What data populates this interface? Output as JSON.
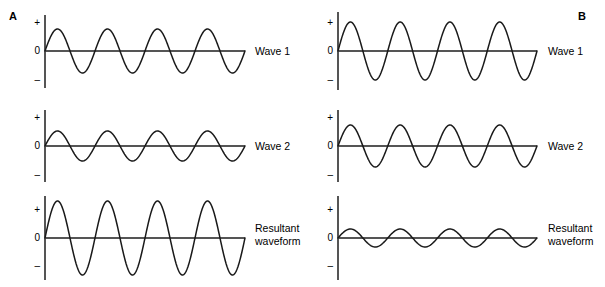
{
  "figure": {
    "width": 605,
    "height": 287,
    "background": "#ffffff",
    "stroke_color": "#1a1a1a",
    "axis_color": "#555555"
  },
  "panels": [
    {
      "id": "panel-a",
      "letter": "A",
      "letter_x": 9,
      "letter_y": 11,
      "interference": "constructive",
      "axis_x": 45,
      "plot_right": 245,
      "label_x": 255,
      "tick_label_x": 26,
      "rows": [
        {
          "id": "wave-1",
          "label": "Wave 1",
          "label_lines": [
            "Wave 1"
          ],
          "baseline_y": 51,
          "axis_top": 15,
          "axis_bottom": 88,
          "ticks": [
            {
              "text": "+",
              "y": 18
            },
            {
              "text": "0",
              "y": 46
            },
            {
              "text": "–",
              "y": 75
            }
          ],
          "amplitude": 22,
          "cycles": 4,
          "phase_deg": 0,
          "inverted": false
        },
        {
          "id": "wave-2",
          "label": "Wave 2",
          "label_lines": [
            "Wave 2"
          ],
          "baseline_y": 146,
          "axis_top": 110,
          "axis_bottom": 182,
          "ticks": [
            {
              "text": "+",
              "y": 113
            },
            {
              "text": "0",
              "y": 141
            },
            {
              "text": "–",
              "y": 170
            }
          ],
          "amplitude": 15,
          "cycles": 4,
          "phase_deg": 0,
          "inverted": false
        },
        {
          "id": "resultant",
          "label": "Resultant waveform",
          "label_lines": [
            "Resultant",
            "waveform"
          ],
          "baseline_y": 238,
          "axis_top": 196,
          "axis_bottom": 280,
          "ticks": [
            {
              "text": "+",
              "y": 205
            },
            {
              "text": "0",
              "y": 233
            },
            {
              "text": "–",
              "y": 261
            }
          ],
          "amplitude": 37,
          "cycles": 4,
          "phase_deg": 0,
          "inverted": false
        }
      ]
    },
    {
      "id": "panel-b",
      "letter": "B",
      "letter_x": 578,
      "letter_y": 11,
      "interference": "destructive",
      "axis_x": 338,
      "plot_right": 537,
      "label_x": 548,
      "tick_label_x": 319,
      "rows": [
        {
          "id": "wave-1",
          "label": "Wave 1",
          "label_lines": [
            "Wave 1"
          ],
          "baseline_y": 51,
          "axis_top": 12,
          "axis_bottom": 90,
          "ticks": [
            {
              "text": "+",
              "y": 18
            },
            {
              "text": "0",
              "y": 46
            },
            {
              "text": "–",
              "y": 75
            }
          ],
          "amplitude": 29,
          "cycles": 4,
          "phase_deg": 0,
          "inverted": false
        },
        {
          "id": "wave-2",
          "label": "Wave 2",
          "label_lines": [
            "Wave 2"
          ],
          "baseline_y": 146,
          "axis_top": 110,
          "axis_bottom": 182,
          "ticks": [
            {
              "text": "+",
              "y": 113
            },
            {
              "text": "0",
              "y": 141
            },
            {
              "text": "–",
              "y": 170
            }
          ],
          "amplitude": 21,
          "cycles": 4,
          "phase_deg": 180,
          "inverted": true
        },
        {
          "id": "resultant",
          "label": "Resultant waveform",
          "label_lines": [
            "Resultant",
            "waveform"
          ],
          "baseline_y": 238,
          "axis_top": 196,
          "axis_bottom": 280,
          "ticks": [
            {
              "text": "+",
              "y": 205
            },
            {
              "text": "0",
              "y": 233
            },
            {
              "text": "–",
              "y": 261
            }
          ],
          "amplitude": 9,
          "cycles": 4,
          "phase_deg": 0,
          "inverted": false
        }
      ]
    }
  ],
  "chart_data": {
    "type": "line",
    "title": "",
    "subtitle": "",
    "xlabel": "",
    "ylabel": "",
    "grid": false,
    "legend_position": "right",
    "y_tick_labels": [
      "+",
      "0",
      "–"
    ],
    "panels": [
      {
        "name": "A",
        "series": [
          {
            "name": "Wave 1",
            "waveform": "sine",
            "amplitude": 1.0,
            "cycles": 4,
            "phase_deg": 0
          },
          {
            "name": "Wave 2",
            "waveform": "sine",
            "amplitude": 0.68,
            "cycles": 4,
            "phase_deg": 0
          },
          {
            "name": "Resultant waveform",
            "waveform": "sine",
            "amplitude": 1.68,
            "cycles": 4,
            "phase_deg": 0
          }
        ]
      },
      {
        "name": "B",
        "series": [
          {
            "name": "Wave 1",
            "waveform": "sine",
            "amplitude": 1.0,
            "cycles": 4,
            "phase_deg": 0
          },
          {
            "name": "Wave 2",
            "waveform": "sine",
            "amplitude": 0.72,
            "cycles": 4,
            "phase_deg": 180
          },
          {
            "name": "Resultant waveform",
            "waveform": "sine",
            "amplitude": 0.31,
            "cycles": 4,
            "phase_deg": 0
          }
        ]
      }
    ]
  }
}
